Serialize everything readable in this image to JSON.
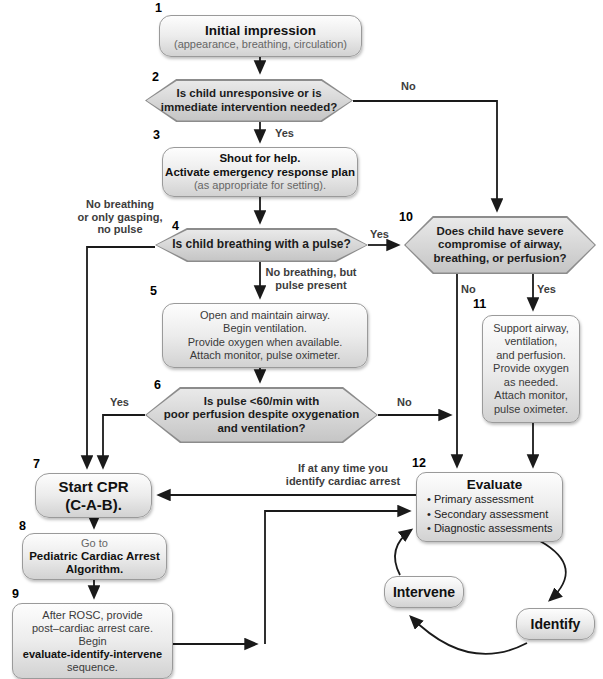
{
  "nodes": {
    "box1": {
      "num": "1",
      "title": "Initial impression",
      "subtitle": "(appearance, breathing, circulation)"
    },
    "hex2": {
      "num": "2",
      "line1": "Is child unresponsive or is",
      "line2": "immediate intervention needed?"
    },
    "box3": {
      "num": "3",
      "line1": "Shout for help.",
      "line2": "Activate emergency response plan",
      "line3": "(as appropriate for setting)."
    },
    "hex4": {
      "num": "4",
      "line1": "Is child breathing with a pulse?"
    },
    "box5": {
      "num": "5",
      "line1": "Open and maintain airway.",
      "line2": "Begin ventilation.",
      "line3": "Provide oxygen when available.",
      "line4": "Attach monitor, pulse oximeter."
    },
    "hex6": {
      "num": "6",
      "line1": "Is pulse <60/min with",
      "line2": "poor perfusion despite oxygenation",
      "line3": "and ventilation?"
    },
    "box7": {
      "num": "7",
      "line1": "Start CPR",
      "line2": "(C-A-B)."
    },
    "box8": {
      "num": "8",
      "line1": "Go to",
      "line2": "Pediatric Cardiac Arrest",
      "line3": "Algorithm."
    },
    "box9": {
      "num": "9",
      "line1": "After ROSC, provide",
      "line2": "post–cardiac arrest care.",
      "line3": "Begin",
      "line4": "evaluate-identify-intervene",
      "line5": "sequence."
    },
    "hex10": {
      "num": "10",
      "line1": "Does child have severe",
      "line2": "compromise of airway,",
      "line3": "breathing, or perfusion?"
    },
    "box11": {
      "num": "11",
      "line1": "Support airway,",
      "line2": "ventilation,",
      "line3": "and perfusion.",
      "line4": "Provide oxygen",
      "line5": "as needed.",
      "line6": "Attach monitor,",
      "line7": "pulse oximeter."
    },
    "box12": {
      "num": "12",
      "title": "Evaluate",
      "bullets": [
        "Primary assessment",
        "Secondary assessment",
        "Diagnostic assessments"
      ]
    },
    "intervene": {
      "label": "Intervene"
    },
    "identify": {
      "label": "Identify"
    }
  },
  "labels": {
    "no2": "No",
    "yes2": "Yes",
    "left4_1": "No breathing",
    "left4_2": "or only gasping,",
    "left4_3": "no pulse",
    "yes4": "Yes",
    "below4_1": "No breathing, but",
    "below4_2": "pulse present",
    "yes6": "Yes",
    "no6": "No",
    "no10": "No",
    "yes10": "Yes",
    "arrest1": "If at any time you",
    "arrest2": "identify cardiac arrest"
  },
  "colors": {
    "box-top": "#fdfdfd",
    "box-mid": "#ececec",
    "box-bottom": "#d2d2d2",
    "hex-top": "#e9e9e9",
    "hex-bottom": "#c5c5c5",
    "border": "#9a9a9a",
    "hex-border": "#8c8c8c",
    "arrow": "#1a1a1a"
  }
}
